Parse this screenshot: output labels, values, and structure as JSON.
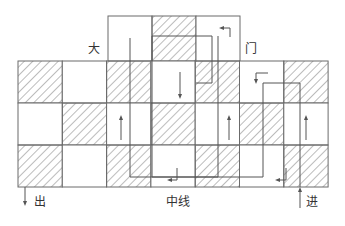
{
  "labels": {
    "gate_left": "大",
    "gate_right": "门",
    "exit": "出",
    "center_line": "中线",
    "enter": "进"
  },
  "grid": {
    "main": {
      "x0": 18,
      "y0": 61,
      "col_width": 44.3,
      "row_height": 42,
      "cols": 7,
      "rows": 3,
      "hatched": [
        [
          true,
          false,
          true,
          false,
          true,
          false,
          true
        ],
        [
          false,
          true,
          false,
          true,
          false,
          true,
          false
        ],
        [
          true,
          false,
          true,
          false,
          true,
          false,
          true
        ]
      ]
    },
    "top": {
      "x0": 108,
      "y0": 16,
      "col_width": 44,
      "row_height": 45,
      "cols": 3,
      "hatched": [
        false,
        true,
        false
      ]
    }
  },
  "colors": {
    "line": "#6b6b6b",
    "hatch": "#7a7a7a",
    "path": "#555555"
  }
}
